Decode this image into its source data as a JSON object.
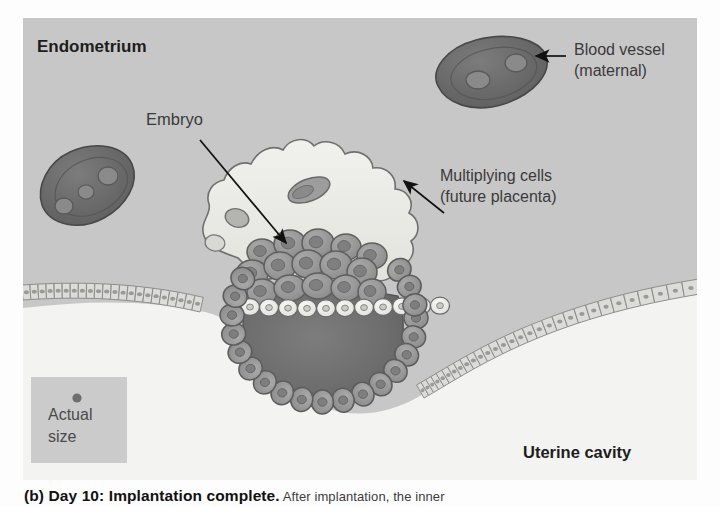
{
  "figure": {
    "title_region": "implantation-diagram",
    "panel": {
      "bg_color": "#c9c9c9",
      "uterine_cavity_color": "#f2f2f0"
    },
    "labels": {
      "endometrium": "Endometrium",
      "blood_vessel_line1": "Blood vessel",
      "blood_vessel_line2": "(maternal)",
      "embryo": "Embryo",
      "multiplying_line1": "Multiplying cells",
      "multiplying_line2": "(future placenta)",
      "uterine_cavity": "Uterine cavity",
      "actual_size_line1": "Actual",
      "actual_size_line2": "size"
    },
    "colors": {
      "endometrium_bg": "#c7c7c7",
      "cavity": "#f3f3f1",
      "vessel_fill": "#6e6e6e",
      "vessel_stroke": "#4a4a4a",
      "trophoblast_halo": "#ebebe7",
      "cell_fill": "#9a9a9a",
      "cell_stroke": "#5c5c5c",
      "blastocoel": "#6a6a6a",
      "epithelium_fill": "#d9d9d6",
      "epithelium_stroke": "#8e8e8e",
      "label_text": "#3a3a3a",
      "bold_text": "#1d1d1d",
      "actual_size_box": "#bdbdbd",
      "actual_size_dot": "#6e6e6e"
    },
    "actual_size_dot_diameter_px": 9
  },
  "caption": {
    "bold_part": "(b) Day 10: Implantation complete.",
    "normal_part": "  After implantation, the inner"
  }
}
